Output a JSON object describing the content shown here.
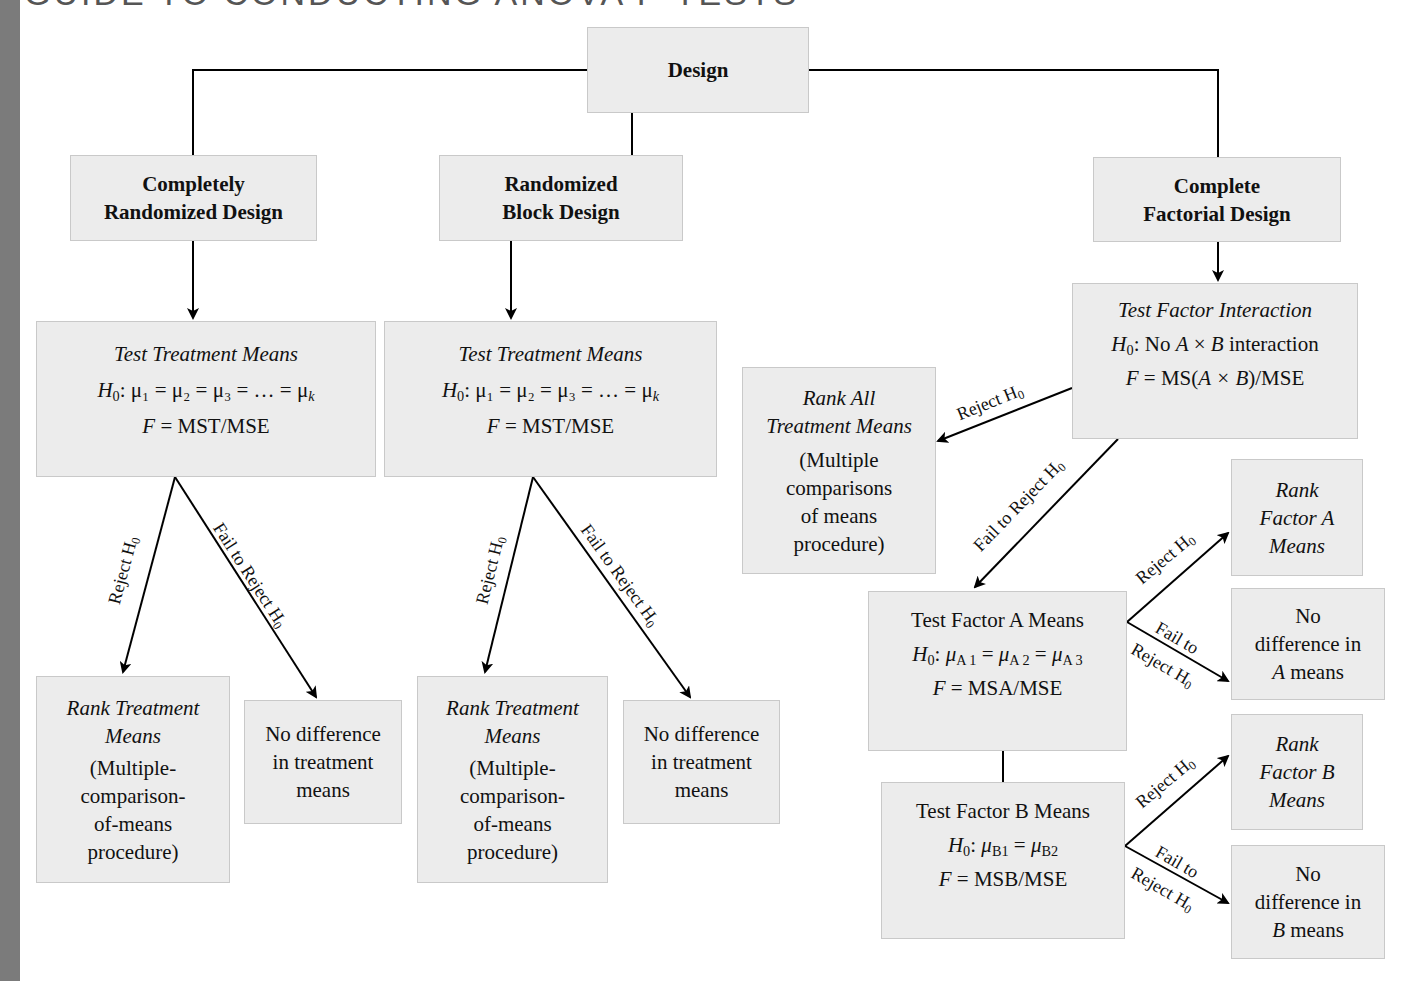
{
  "title": "GUIDE TO CONDUCTING ANOVA F-TESTS",
  "colors": {
    "box_fill": "#ececec",
    "box_border": "#c9c9c9",
    "edge_strip": "#7b7b7b",
    "lines": "#000000"
  },
  "nodes": {
    "design": {
      "label": "Design"
    },
    "crd": {
      "line1": "Completely",
      "line2": "Randomized Design"
    },
    "rbd": {
      "line1": "Randomized",
      "line2": "Block Design"
    },
    "cfd": {
      "line1": "Complete",
      "line2": "Factorial Design"
    },
    "crd_test": {
      "title": "Test Treatment Means",
      "h0_prefix": "H",
      "h0_sub": "0",
      "h0_body": ": μ₁ = μ₂ = μ₃ = … = μ",
      "h0_last_sub": "k",
      "f_var": "F",
      "f_body": " = MST/MSE"
    },
    "rbd_test": {
      "title": "Test Treatment Means",
      "h0_prefix": "H",
      "h0_sub": "0",
      "h0_body": ": μ₁ = μ₂ = μ₃ = … = μ",
      "h0_last_sub": "k",
      "f_var": "F",
      "f_body": " = MST/MSE"
    },
    "crd_rank": {
      "line1": "Rank Treatment",
      "line2": "Means",
      "line3": "(Multiple-",
      "line4": "comparison-",
      "line5": "of-means",
      "line6": "procedure)"
    },
    "crd_nodiff": {
      "line1": "No difference",
      "line2": "in treatment",
      "line3": "means"
    },
    "rbd_rank": {
      "line1": "Rank Treatment",
      "line2": "Means",
      "line3": "(Multiple-",
      "line4": "comparison-",
      "line5": "of-means",
      "line6": "procedure)"
    },
    "rbd_nodiff": {
      "line1": "No difference",
      "line2": "in treatment",
      "line3": "means"
    },
    "interaction_test": {
      "title": "Test Factor Interaction",
      "h0_prefix": "H",
      "h0_sub": "0",
      "h0_a": ": No ",
      "h0_avar": "A",
      "h0_times": " × ",
      "h0_bvar": "B",
      "h0_tail": " interaction",
      "f_var": "F",
      "f_eq": " = MS(",
      "f_inner": "A × B",
      "f_tail": ")/MSE"
    },
    "rank_all": {
      "line1": "Rank All",
      "line2": "Treatment Means",
      "line3": "(Multiple",
      "line4": "comparisons",
      "line5": "of means",
      "line6": "procedure)"
    },
    "factor_a_test": {
      "title": "Test Factor A Means",
      "h0_prefix": "H",
      "h0_sub": "0",
      "mu": "μ",
      "s1": "A 1",
      "s2": "A 2",
      "s3": "A 3",
      "f_var": "F",
      "f_body": " = MSA/MSE"
    },
    "factor_b_test": {
      "title": "Test Factor B Means",
      "h0_prefix": "H",
      "h0_sub": "0",
      "mu": "μ",
      "s1": "B1",
      "s2": "B2",
      "f_var": "F",
      "f_body": " = MSB/MSE"
    },
    "rank_a": {
      "line1": "Rank",
      "line2": "Factor A",
      "line3": "Means"
    },
    "nodiff_a": {
      "line1": "No",
      "line2": "difference in",
      "line3_var": "A",
      "line3_tail": " means"
    },
    "rank_b": {
      "line1": "Rank",
      "line2": "Factor B",
      "line3": "Means"
    },
    "nodiff_b": {
      "line1": "No",
      "line2": "difference in",
      "line3_var": "B",
      "line3_tail": " means"
    }
  },
  "edge_labels": {
    "reject": "Reject ",
    "fail_reject": "Fail to Reject ",
    "fail_to": "Fail to",
    "reject_short": "Reject ",
    "h": "H",
    "h_sub": "0"
  }
}
